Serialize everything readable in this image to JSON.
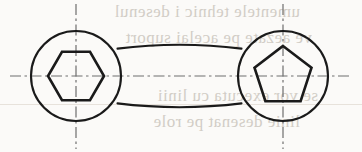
{
  "page": {
    "kind": "scanned-textbook-figure",
    "width": 362,
    "height": 152,
    "paper_color": "#fbfaf8",
    "ink_color": "#1a1a1a",
    "centerline_color": "#6e6e6e"
  },
  "bleed_through_text": {
    "note": "faint mirrored text showing through from the reverse side of the page",
    "color": "#b9b2a8",
    "lines": [
      "umentele tehnic i desenul",
      "ve aezate pe acelai suport",
      "se vor executa cu linii",
      "linie  desenat pe role"
    ]
  },
  "figure": {
    "name": "two-headed-wrench-outline",
    "line_width_outline": 2.1,
    "line_width_socket": 2.6,
    "line_width_centerline": 1.2,
    "centerline_dash": "11 3.5 2.5 3.5",
    "left_head": {
      "label": "hexagon-socket-head",
      "center_x": 76,
      "center_y": 76,
      "radius": 45,
      "socket": {
        "shape": "hexagon",
        "sides": 6,
        "circumradius": 28,
        "orientation_deg": 0,
        "vertices": "104,76 90,100.2 62,100.2 48,76 62,51.8 90,51.8"
      }
    },
    "right_head": {
      "label": "pentagon-socket-head",
      "center_x": 283,
      "center_y": 76,
      "radius": 45,
      "socket": {
        "shape": "pentagon",
        "sides": 5,
        "circumradius": 30,
        "orientation_deg": -90,
        "vertices": "283,46 311.5,67.7 300.6,101.2 265.4,101.2 254.5,67.7"
      }
    },
    "bar": {
      "label": "connecting-bar",
      "top_edge_y": 48,
      "bottom_edge_y": 104,
      "left_junction_x": 118,
      "right_junction_x": 241,
      "waist_curve": true
    },
    "centerlines": {
      "horizontal": {
        "y": 76,
        "x_start": 10,
        "x_end": 349
      },
      "vertical_left": {
        "x": 76,
        "y_start": 4,
        "y_end": 149
      },
      "vertical_right": {
        "x": 283,
        "y_start": 4,
        "y_end": 149
      }
    }
  }
}
